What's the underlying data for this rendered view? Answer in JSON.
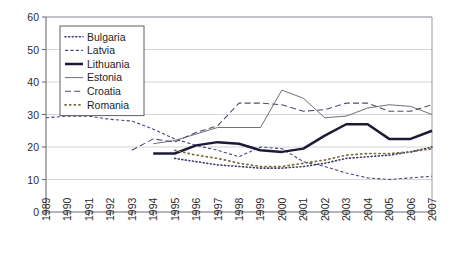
{
  "chart_data": {
    "type": "line",
    "title": "",
    "xlabel": "",
    "ylabel": "",
    "xlim": [
      1989,
      2007
    ],
    "ylim": [
      0,
      60
    ],
    "yticks": [
      0,
      10,
      20,
      30,
      40,
      50,
      60
    ],
    "grid": true,
    "legend_position": "top-left",
    "x": [
      1989,
      1990,
      1991,
      1992,
      1993,
      1994,
      1995,
      1996,
      1997,
      1998,
      1999,
      2000,
      2001,
      2002,
      2003,
      2004,
      2005,
      2006,
      2007
    ],
    "series": [
      {
        "name": "Bulgaria",
        "style": "dotted",
        "color": "#3a3a6b",
        "x": [
          1995,
          1996,
          1997,
          1998,
          1999,
          2000,
          2001,
          2002,
          2003,
          2004,
          2005,
          2006,
          2007
        ],
        "values": [
          16.5,
          15.5,
          14.5,
          14.0,
          13.5,
          13.5,
          14.0,
          15.0,
          16.5,
          17.0,
          17.5,
          18.5,
          20.0
        ]
      },
      {
        "name": "Latvia",
        "style": "dashed-short",
        "color": "#4a4a7a",
        "x": [
          1989,
          1990,
          1991,
          1992,
          1993,
          1994,
          1995,
          1996,
          1997,
          1998,
          1999,
          2000,
          2001,
          2002,
          2003,
          2004,
          2005,
          2006,
          2007
        ],
        "values": [
          29.0,
          29.5,
          29.5,
          28.5,
          28.0,
          25.5,
          22.5,
          20.5,
          19.0,
          17.0,
          20.0,
          19.5,
          15.5,
          14.0,
          12.0,
          10.5,
          10.0,
          10.5,
          11.0
        ]
      },
      {
        "name": "Lithuania",
        "style": "solid-thick",
        "color": "#1b1b38",
        "x": [
          1994,
          1995,
          1996,
          1997,
          1998,
          1999,
          2000,
          2001,
          2002,
          2003,
          2004,
          2005,
          2006,
          2007
        ],
        "values": [
          18.0,
          18.0,
          20.5,
          21.5,
          21.0,
          19.0,
          18.5,
          19.5,
          23.5,
          27.0,
          27.0,
          22.5,
          22.5,
          25.0
        ]
      },
      {
        "name": "Estonia",
        "style": "solid-thin",
        "color": "#6f6f7d",
        "x": [
          1994,
          1995,
          1996,
          1997,
          1998,
          1999,
          2000,
          2001,
          2002,
          2003,
          2004,
          2005,
          2006,
          2007
        ],
        "values": [
          21.0,
          22.0,
          24.0,
          26.0,
          26.0,
          26.0,
          37.5,
          35.0,
          29.0,
          29.5,
          32.0,
          33.0,
          32.5,
          30.0
        ]
      },
      {
        "name": "Croatia",
        "style": "dashed-long",
        "color": "#4d4d72",
        "x": [
          1993,
          1994,
          1995,
          1996,
          1997,
          1998,
          1999,
          2000,
          2001,
          2002,
          2003,
          2004,
          2005,
          2006,
          2007
        ],
        "values": [
          19.0,
          22.5,
          21.5,
          24.5,
          26.5,
          33.5,
          33.5,
          33.0,
          31.0,
          31.5,
          33.5,
          33.5,
          31.0,
          31.0,
          33.0
        ]
      },
      {
        "name": "Romania",
        "style": "dot-dash",
        "color": "#7a6a3a",
        "x": [
          1995,
          1996,
          1997,
          1998,
          1999,
          2000,
          2001,
          2002,
          2003,
          2004,
          2005,
          2006,
          2007
        ],
        "values": [
          19.0,
          17.5,
          16.5,
          15.0,
          14.0,
          14.0,
          15.0,
          16.0,
          17.5,
          18.0,
          18.0,
          18.5,
          19.5
        ]
      }
    ]
  },
  "legend": {
    "items": [
      {
        "label": "Bulgaria"
      },
      {
        "label": "Latvia"
      },
      {
        "label": "Lithuania"
      },
      {
        "label": "Estonia"
      },
      {
        "label": "Croatia"
      },
      {
        "label": "Romania"
      }
    ]
  },
  "axes": {
    "y_labels": [
      "60",
      "50",
      "40",
      "30",
      "20",
      "10",
      "0"
    ],
    "x_labels": [
      "1989",
      "1990",
      "1991",
      "1992",
      "1993",
      "1994",
      "1995",
      "1996",
      "1997",
      "1998",
      "1999",
      "2000",
      "2001",
      "2002",
      "2003",
      "2004",
      "2005",
      "2006",
      "2007"
    ]
  },
  "colors": {
    "axis": "#8a8a96",
    "grid": "#c8c8d0",
    "plot_border": "#9a9aa6",
    "background": "#ffffff"
  }
}
